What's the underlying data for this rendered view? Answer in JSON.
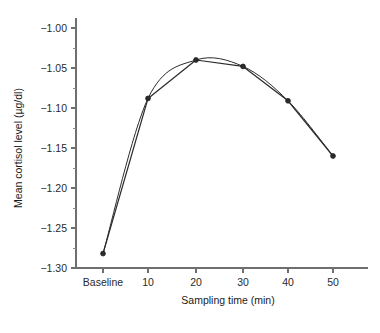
{
  "chart_data": {
    "type": "line",
    "title": "",
    "xlabel": "Sampling time (min)",
    "ylabel": "Mean cortisol level (µg/dl)",
    "categories": [
      "Baseline",
      "10",
      "20",
      "30",
      "40",
      "50"
    ],
    "ylim": [
      -1.3,
      -1.0
    ],
    "ytick_labels": [
      "−1.00",
      "−1.05",
      "−1.10",
      "−1.15",
      "−1.20",
      "−1.25",
      "−1.30"
    ],
    "ytick_values": [
      -1.0,
      -1.05,
      -1.1,
      -1.15,
      -1.2,
      -1.25,
      -1.3
    ],
    "yminor_values": [
      -1.025,
      -1.075,
      -1.125,
      -1.175,
      -1.225,
      -1.275
    ],
    "grid": false,
    "legend": "none",
    "series": [
      {
        "name": "Mean cortisol level",
        "style": "line-with-markers",
        "color": "#2b2b2b",
        "values": [
          -1.282,
          -1.088,
          -1.04,
          -1.048,
          -1.091,
          -1.16
        ]
      },
      {
        "name": "Smoothed trend",
        "style": "smooth-curve",
        "color": "#2b2b2b",
        "values": [
          -1.282,
          -1.088,
          -1.04,
          -1.048,
          -1.091,
          -1.16
        ]
      }
    ]
  },
  "axes": {
    "y_tick_count": 7,
    "x_tick_count": 6
  }
}
